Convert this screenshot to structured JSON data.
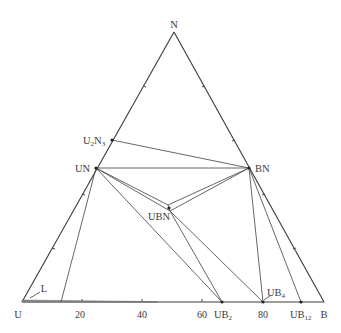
{
  "diagram": {
    "type": "ternary-phase-diagram",
    "corners": {
      "top": {
        "label": "N",
        "x": 174,
        "y": 32
      },
      "left": {
        "label": "U",
        "x": 22,
        "y": 302
      },
      "right": {
        "label": "B",
        "x": 324,
        "y": 302
      }
    },
    "base_axis_ticks": [
      {
        "label": "20",
        "x": 82
      },
      {
        "label": "40",
        "x": 142
      },
      {
        "label": "60",
        "x": 202
      },
      {
        "label": "80",
        "x": 263
      }
    ],
    "phases": [
      {
        "id": "U2N3",
        "label": "U",
        "sub1": "2",
        "mid": "N",
        "sub2": "3",
        "x": 112,
        "y": 140
      },
      {
        "id": "UN",
        "label": "UN",
        "x": 96,
        "y": 168
      },
      {
        "id": "BN",
        "label": "BN",
        "x": 249,
        "y": 168
      },
      {
        "id": "UBN",
        "label": "UBN",
        "x": 169,
        "y": 208
      },
      {
        "id": "UB2",
        "label": "UB",
        "sub": "2",
        "x": 222,
        "y": 302
      },
      {
        "id": "UB4",
        "label": "UB",
        "sub": "4",
        "x": 263,
        "y": 302
      },
      {
        "id": "UB12",
        "label": "UB",
        "sub": "12",
        "x": 301,
        "y": 302
      }
    ],
    "liquid_label": "L",
    "tie_lines": [
      [
        "U2N3",
        "BN"
      ],
      [
        "UN",
        "BN"
      ],
      [
        "UN",
        "UBN"
      ],
      [
        "BN",
        "UBN"
      ],
      [
        "UN",
        "UB2"
      ],
      [
        "UBN",
        "UB2"
      ],
      [
        "UBN",
        "UB4"
      ],
      [
        "BN",
        "UB4"
      ],
      [
        "BN",
        "UB12"
      ],
      [
        "UN",
        "L-edge"
      ]
    ]
  }
}
